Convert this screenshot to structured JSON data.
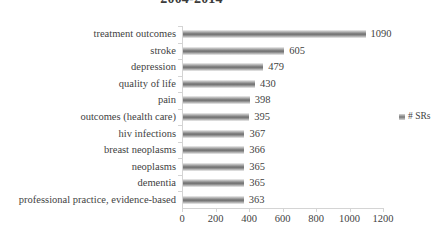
{
  "chart_data": {
    "type": "bar",
    "orientation": "horizontal",
    "title": "2004-2014",
    "xlabel": "",
    "ylabel": "",
    "xlim": [
      0,
      1200
    ],
    "xticks": [
      0,
      200,
      400,
      600,
      800,
      1000,
      1200
    ],
    "xtick_labels": [
      "0",
      "200",
      "400",
      "600",
      "800",
      "1000",
      "1200"
    ],
    "grid": false,
    "legend_position": "right",
    "categories": [
      "treatment outcomes",
      "stroke",
      "depression",
      "quality of life",
      "pain",
      "outcomes (health care)",
      "hiv infections",
      "breast neoplasms",
      "neoplasms",
      "dementia",
      "professional practice, evidence-based"
    ],
    "values": [
      1090,
      605,
      479,
      430,
      398,
      395,
      367,
      366,
      365,
      365,
      363
    ],
    "value_labels": [
      "1090",
      "605",
      "479",
      "430",
      "398",
      "395",
      "367",
      "366",
      "365",
      "365",
      "363"
    ],
    "series": [
      {
        "name": "# SRs",
        "values": [
          1090,
          605,
          479,
          430,
          398,
          395,
          367,
          366,
          365,
          365,
          363
        ]
      }
    ],
    "legend": [
      "# SRs"
    ],
    "colors": {
      "bar_dark": "#6f6f6f",
      "bar_light": "#f3f3f3",
      "axis": "#d4d4d4",
      "text": "#3f3f3f",
      "background": "#ffffff"
    }
  }
}
